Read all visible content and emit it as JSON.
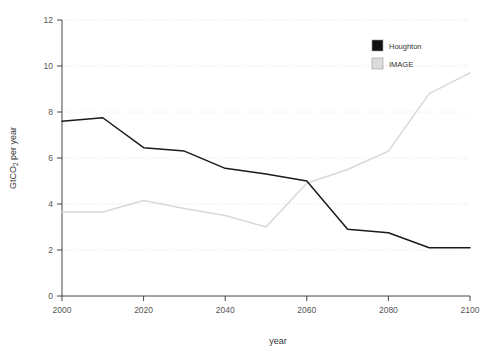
{
  "chart_data": {
    "type": "line",
    "title": "",
    "xlabel": "year",
    "ylabel": "GtCO2 per year",
    "ylabel_parts": {
      "pre": "GtCO",
      "sub": "2",
      "post": " per year"
    },
    "x": [
      2000,
      2010,
      2020,
      2030,
      2040,
      2050,
      2060,
      2070,
      2080,
      2090,
      2100
    ],
    "xlim": [
      2000,
      2100
    ],
    "ylim": [
      0,
      12
    ],
    "xticks": [
      2000,
      2020,
      2040,
      2060,
      2080,
      2100
    ],
    "yticks": [
      0,
      2,
      4,
      6,
      8,
      10,
      12
    ],
    "xtick_labels": [
      "2000",
      "2020",
      "2040",
      "2060",
      "2080",
      "2100"
    ],
    "ytick_labels": [
      "0",
      "2",
      "4",
      "6",
      "8",
      "10",
      "12"
    ],
    "grid": "horizontal-dotted",
    "legend_position": "top-right-inside",
    "series": [
      {
        "name": "Houghton",
        "color": "#1a1a1a",
        "values": [
          7.6,
          7.75,
          6.45,
          6.3,
          5.55,
          5.3,
          5.0,
          2.9,
          2.75,
          2.1,
          2.1
        ]
      },
      {
        "name": "IMAGE",
        "color": "#d8d8d8",
        "values": [
          3.65,
          3.65,
          4.15,
          3.8,
          3.5,
          3.0,
          4.9,
          5.5,
          6.3,
          8.8,
          9.7
        ]
      }
    ]
  },
  "legend": {
    "entries": [
      {
        "label": "Houghton",
        "swatch": "#111111"
      },
      {
        "label": "IMAGE",
        "swatch": "#dcdcdc"
      }
    ]
  },
  "axes": {
    "x_title": "year",
    "y_title_pre": "GtCO",
    "y_title_sub": "2",
    "y_title_post": " per year"
  },
  "colors": {
    "grid": "#f0dede",
    "axis": "#444444",
    "series_houghton": "#1a1a1a",
    "series_image": "#d8d8d8",
    "background": "#ffffff"
  }
}
